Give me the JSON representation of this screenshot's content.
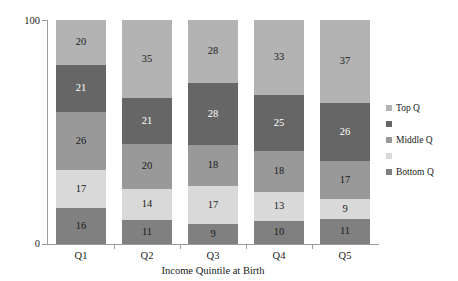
{
  "chart_data": {
    "type": "bar",
    "stacked": true,
    "title": "",
    "xlabel": "Income Quintile at Birth",
    "ylabel": "",
    "ylim": [
      0,
      100
    ],
    "ytick_labels": [
      "0",
      "100"
    ],
    "grid": false,
    "legend_position": "right",
    "categories": [
      "Q1",
      "Q2",
      "Q3",
      "Q4",
      "Q5"
    ],
    "series": [
      {
        "name": "Top Q",
        "legend_label": "Top Q",
        "color": "#b3b3b3",
        "label_color": "dark",
        "values": [
          20,
          35,
          28,
          33,
          37
        ]
      },
      {
        "name": "Series 2",
        "legend_label": "",
        "color": "#666666",
        "label_color": "light",
        "values": [
          21,
          21,
          28,
          25,
          26
        ]
      },
      {
        "name": "Middle Q",
        "legend_label": "Middle Q",
        "color": "#999999",
        "label_color": "dark",
        "values": [
          26,
          20,
          18,
          18,
          17
        ]
      },
      {
        "name": "Series 4",
        "legend_label": "",
        "color": "#d9d9d9",
        "label_color": "dark",
        "values": [
          17,
          14,
          17,
          13,
          9
        ]
      },
      {
        "name": "Bottom Q",
        "legend_label": "Bottom Q",
        "color": "#808080",
        "label_color": "dark",
        "values": [
          16,
          11,
          9,
          10,
          11
        ]
      }
    ]
  },
  "axis": {
    "y_top_label": "100",
    "y_bottom_label": "0",
    "x_title": "Income Quintile at Birth"
  },
  "legend": {
    "items": [
      {
        "label": "Top Q",
        "color": "#b3b3b3"
      },
      {
        "label": "",
        "color": "#666666"
      },
      {
        "label": "Middle Q",
        "color": "#999999"
      },
      {
        "label": "",
        "color": "#d9d9d9"
      },
      {
        "label": "Bottom Q",
        "color": "#808080"
      }
    ]
  }
}
